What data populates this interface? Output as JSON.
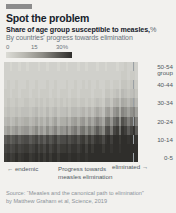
{
  "card": {
    "tag": "",
    "title": "Spot the problem",
    "subtitle": "Share of age group susceptible to measles,",
    "subtitle_unit": "%",
    "subtitle2": "By countries' progress towards elimination"
  },
  "legend": {
    "ticks": [
      "0",
      "15",
      "30%"
    ],
    "gradient_low": "#dcdcd6",
    "gradient_high": "#2f2e2b"
  },
  "axis": {
    "age_group_label_line1": "Age",
    "age_group_label_line2": "group",
    "age_labels": [
      "50-54",
      "40-44",
      "30-34",
      "20-24",
      "10-14",
      "0-5"
    ]
  },
  "annotations": {
    "left": "← endemic",
    "center_line1": "Progress towards",
    "center_line2": "measles elimination",
    "right": "eliminated →"
  },
  "source": {
    "line1": "Source: “Measles and the canonical path to elimination”",
    "line2": "by Matthew Graham et al, Science, 2019"
  },
  "chart_data": {
    "type": "heatmap",
    "title": "Spot the problem",
    "subtitle": "Share of age group susceptible to measles, %",
    "xlabel": "By countries' progress towards elimination",
    "ylabel": "Age group",
    "zlabel": "Share of age group susceptible to measles, %",
    "zlim": [
      0,
      30
    ],
    "grid": false,
    "legend_position": "top-left",
    "colorscale": [
      "#dcdcd6",
      "#2f2e2b"
    ],
    "y_categories": [
      "0-5",
      "5-9",
      "10-14",
      "15-19",
      "20-24",
      "25-29",
      "30-34",
      "35-39",
      "40-44",
      "45-49",
      "50-54"
    ],
    "y_tick_labels": [
      "50-54",
      "40-44",
      "30-34",
      "20-24",
      "10-14",
      "0-5"
    ],
    "x_note": "Countries ordered left (endemic) to right (eliminated); ~48 country columns, unlabeled",
    "n_columns": 48,
    "rows": [
      {
        "age": "50-54",
        "values": [
          2,
          2,
          1,
          2,
          2,
          1,
          2,
          2,
          1,
          2,
          2,
          2,
          1,
          2,
          2,
          1,
          2,
          2,
          2,
          1,
          2,
          2,
          1,
          2,
          2,
          2,
          1,
          2,
          2,
          1,
          2,
          2,
          2,
          1,
          2,
          2,
          1,
          2,
          2,
          2,
          1,
          2,
          2,
          3,
          2,
          2,
          3,
          2
        ]
      },
      {
        "age": "45-49",
        "values": [
          2,
          2,
          2,
          2,
          2,
          2,
          2,
          2,
          2,
          2,
          2,
          2,
          2,
          2,
          2,
          2,
          2,
          2,
          2,
          2,
          2,
          2,
          2,
          2,
          2,
          2,
          2,
          2,
          2,
          2,
          2,
          2,
          2,
          2,
          2,
          2,
          2,
          2,
          2,
          2,
          2,
          2,
          3,
          3,
          2,
          3,
          3,
          2
        ]
      },
      {
        "age": "40-44",
        "values": [
          2,
          3,
          2,
          2,
          3,
          2,
          2,
          2,
          3,
          2,
          2,
          3,
          2,
          2,
          2,
          3,
          2,
          2,
          3,
          2,
          2,
          2,
          3,
          2,
          2,
          3,
          2,
          2,
          3,
          2,
          3,
          2,
          2,
          3,
          2,
          2,
          3,
          3,
          2,
          3,
          3,
          2,
          4,
          4,
          3,
          4,
          4,
          3
        ]
      },
      {
        "age": "35-39",
        "values": [
          3,
          3,
          2,
          3,
          3,
          2,
          3,
          3,
          3,
          2,
          3,
          3,
          2,
          3,
          3,
          3,
          2,
          3,
          3,
          2,
          3,
          3,
          3,
          2,
          3,
          3,
          2,
          3,
          3,
          3,
          3,
          2,
          3,
          3,
          3,
          2,
          4,
          4,
          3,
          4,
          5,
          3,
          6,
          5,
          4,
          5,
          6,
          4
        ]
      },
      {
        "age": "30-34",
        "values": [
          3,
          4,
          3,
          3,
          4,
          3,
          3,
          4,
          4,
          3,
          3,
          4,
          3,
          4,
          3,
          4,
          3,
          3,
          4,
          3,
          4,
          3,
          4,
          3,
          4,
          4,
          3,
          4,
          4,
          3,
          4,
          3,
          4,
          5,
          4,
          3,
          6,
          6,
          4,
          7,
          8,
          5,
          9,
          8,
          6,
          8,
          9,
          6
        ]
      },
      {
        "age": "25-29",
        "values": [
          4,
          5,
          4,
          4,
          5,
          4,
          5,
          5,
          5,
          4,
          5,
          6,
          4,
          5,
          4,
          6,
          4,
          5,
          6,
          4,
          5,
          5,
          6,
          4,
          6,
          6,
          5,
          6,
          7,
          5,
          7,
          5,
          7,
          9,
          7,
          5,
          10,
          11,
          7,
          12,
          14,
          8,
          15,
          13,
          10,
          13,
          15,
          10
        ]
      },
      {
        "age": "20-24",
        "values": [
          6,
          7,
          5,
          6,
          8,
          6,
          7,
          8,
          8,
          6,
          7,
          9,
          6,
          8,
          6,
          9,
          6,
          8,
          10,
          6,
          8,
          8,
          10,
          7,
          10,
          11,
          8,
          11,
          12,
          8,
          12,
          9,
          12,
          15,
          12,
          9,
          17,
          18,
          12,
          19,
          22,
          13,
          24,
          21,
          16,
          20,
          23,
          16
        ]
      },
      {
        "age": "15-19",
        "values": [
          9,
          11,
          8,
          10,
          12,
          9,
          11,
          12,
          12,
          9,
          11,
          14,
          9,
          12,
          9,
          14,
          10,
          12,
          15,
          10,
          13,
          12,
          16,
          11,
          15,
          17,
          12,
          17,
          18,
          13,
          18,
          14,
          18,
          22,
          18,
          14,
          24,
          25,
          17,
          26,
          28,
          19,
          29,
          27,
          22,
          26,
          29,
          22
        ]
      },
      {
        "age": "10-14",
        "values": [
          22,
          24,
          21,
          23,
          25,
          22,
          24,
          25,
          25,
          22,
          24,
          26,
          22,
          25,
          22,
          26,
          23,
          25,
          27,
          23,
          25,
          25,
          27,
          24,
          26,
          27,
          24,
          27,
          28,
          24,
          28,
          25,
          28,
          29,
          28,
          25,
          29,
          30,
          27,
          30,
          30,
          28,
          30,
          30,
          29,
          30,
          30,
          29
        ]
      },
      {
        "age": "5-9",
        "values": [
          26,
          27,
          25,
          26,
          28,
          26,
          27,
          28,
          28,
          26,
          27,
          29,
          26,
          28,
          26,
          29,
          26,
          28,
          29,
          26,
          28,
          28,
          29,
          27,
          29,
          29,
          27,
          29,
          30,
          27,
          30,
          28,
          30,
          30,
          30,
          28,
          30,
          30,
          29,
          30,
          30,
          29,
          30,
          30,
          30,
          30,
          30,
          30
        ]
      },
      {
        "age": "0-5",
        "values": [
          28,
          29,
          27,
          28,
          30,
          28,
          29,
          30,
          30,
          28,
          29,
          30,
          28,
          30,
          28,
          30,
          28,
          30,
          30,
          28,
          30,
          30,
          30,
          29,
          30,
          30,
          29,
          30,
          30,
          29,
          30,
          30,
          30,
          30,
          30,
          30,
          30,
          30,
          30,
          30,
          30,
          30,
          30,
          30,
          30,
          30,
          30,
          30
        ]
      }
    ]
  }
}
